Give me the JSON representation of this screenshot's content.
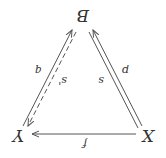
{
  "diagram": {
    "orientation": "rotated 180 degrees",
    "nodes": {
      "X": "X",
      "Y": "Y",
      "B": "B"
    },
    "edges": {
      "f": "f",
      "p": "p",
      "q": "q",
      "s": "s",
      "s_prime": "s'"
    },
    "colors": {
      "stroke": "#555555",
      "text": "#333333"
    }
  }
}
